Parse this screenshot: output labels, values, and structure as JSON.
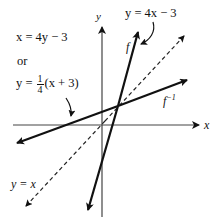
{
  "figure": {
    "type": "function-and-inverse-graph",
    "axes": {
      "x_label": "x",
      "y_label": "y",
      "x_axis": {
        "x1": 13,
        "y1": 125,
        "x2": 199,
        "y2": 125
      },
      "y_axis": {
        "x1": 102,
        "y1": 217,
        "x2": 102,
        "y2": 27
      }
    },
    "lines": [
      {
        "name": "f",
        "label": "f",
        "equation": "y = 4x − 3",
        "style": "solid",
        "x1": 88,
        "y1": 210,
        "x2": 138,
        "y2": 32
      },
      {
        "name": "f-inverse",
        "label": "f",
        "label_sup": "−1",
        "equation": "y = ¼(x + 3)",
        "style": "solid",
        "x1": 17,
        "y1": 143,
        "x2": 187,
        "y2": 80
      },
      {
        "name": "identity",
        "label": "y = x",
        "style": "dashed",
        "x1": 26,
        "y1": 206,
        "x2": 184,
        "y2": 36
      }
    ],
    "intersection": {
      "x": 118,
      "y": 106
    },
    "colors": {
      "ink": "#111111",
      "axis": "#444444",
      "background": "#ffffff"
    }
  },
  "annotations": {
    "inverse_eq_line1": "x = 4y − 3",
    "connector": "or",
    "inverse_eq_prefix": "y =",
    "inverse_eq_frac_num": "1",
    "inverse_eq_frac_den": "4",
    "inverse_eq_suffix": "(x + 3)",
    "f_equation": "y = 4x − 3",
    "f_label": "f",
    "finv_label": "f",
    "finv_sup": "−1",
    "identity_label": "y = x",
    "x_axis_label": "x",
    "y_axis_label": "y"
  }
}
